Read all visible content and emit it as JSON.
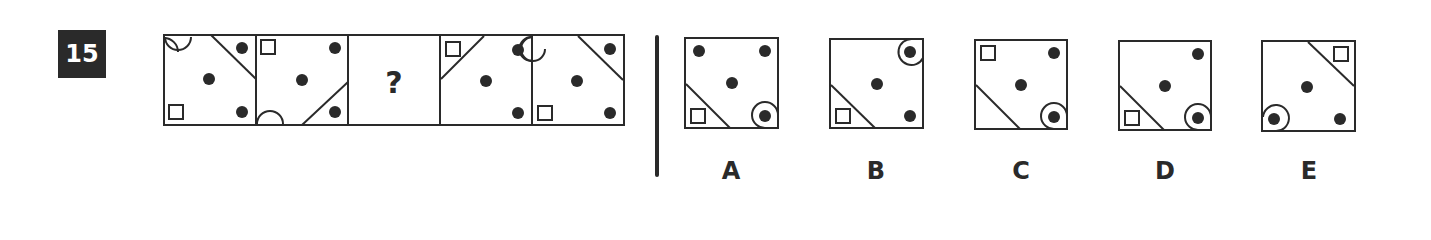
{
  "question": {
    "number": "15",
    "missing_marker": "?",
    "sequence": [
      {
        "index": 1,
        "contents": [
          "half-circle top-left",
          "diagonal cut top-right with dot",
          "center dot",
          "small square bottom-left",
          "dot bottom-right"
        ]
      },
      {
        "index": 2,
        "contents": [
          "small square top-left",
          "dot top-right",
          "center dot",
          "half-circle bottom-left",
          "diagonal cut bottom-right with dot"
        ]
      },
      {
        "index": 3,
        "contents": [
          "question mark"
        ]
      },
      {
        "index": 4,
        "contents": [
          "diagonal cut top-left with small square",
          "circled dot top-right",
          "center dot",
          "dot bottom-right"
        ]
      },
      {
        "index": 5,
        "contents": [
          "half-circle top-left",
          "diagonal cut top-right with dot",
          "center dot",
          "small square bottom-left",
          "dot bottom-right"
        ]
      }
    ]
  },
  "options": [
    {
      "label": "A",
      "contents": [
        "dot top-left",
        "dot top-right",
        "center dot",
        "diagonal cut bottom-left with small square",
        "circled dot bottom-right"
      ]
    },
    {
      "label": "B",
      "contents": [
        "circled dot top-right",
        "center dot",
        "diagonal cut bottom-left with small square",
        "dot bottom-right"
      ]
    },
    {
      "label": "C",
      "contents": [
        "small square top-left",
        "dot top-right",
        "center dot",
        "diagonal cut bottom-left",
        "circled dot bottom-right"
      ]
    },
    {
      "label": "D",
      "contents": [
        "dot top-right",
        "center dot",
        "diagonal cut bottom-left with small square",
        "circled dot bottom-right"
      ]
    },
    {
      "label": "E",
      "contents": [
        "diagonal cut top-right with small square",
        "center dot",
        "circled dot bottom-left",
        "dot bottom-right"
      ]
    }
  ],
  "colors": {
    "ink": "#2a2a2a",
    "badge_bg": "#2a2a2a",
    "badge_text": "#ffffff",
    "background": "#ffffff"
  }
}
